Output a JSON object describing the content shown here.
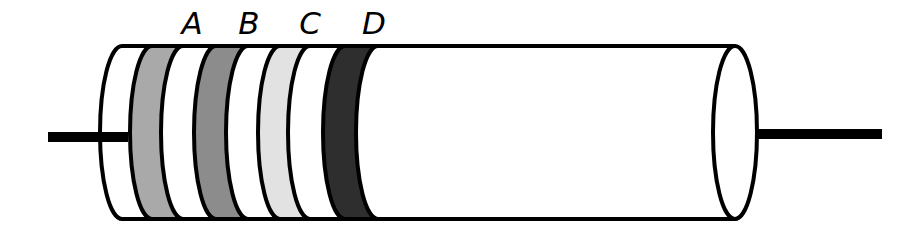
{
  "figure": {
    "name": "resistor-color-band-diagram",
    "background_color": "#ffffff",
    "outline_color": "#000000",
    "body_fill": "#ffffff",
    "width": 919,
    "height": 239
  },
  "body": {
    "label": "resistor-body",
    "left_x": 122,
    "right_x": 735,
    "top_y": 46,
    "bottom_y": 219,
    "cap_rx": 22,
    "stroke_width": 4
  },
  "leads": [
    {
      "name": "left-lead",
      "label": "Left lead wire",
      "color": "#000000",
      "x1": 48,
      "x2": 128,
      "y": 137,
      "thickness": 10
    },
    {
      "name": "right-lead",
      "label": "Right lead wire",
      "color": "#000000",
      "x1": 730,
      "x2": 882,
      "y": 134,
      "thickness": 10
    }
  ],
  "bands": [
    {
      "id": "A",
      "label": "A",
      "name": "color-band-a",
      "fill": "#a9a9a9",
      "left_x": 152,
      "right_x": 183,
      "label_x": 192,
      "label_y": 34
    },
    {
      "id": "B",
      "label": "B",
      "name": "color-band-b",
      "fill": "#8c8c8c",
      "left_x": 216,
      "right_x": 248,
      "label_x": 249,
      "label_y": 34
    },
    {
      "id": "C",
      "label": "C",
      "name": "color-band-c",
      "fill": "#e2e2e2",
      "left_x": 280,
      "right_x": 310,
      "label_x": 310,
      "label_y": 34
    },
    {
      "id": "D",
      "label": "D",
      "name": "color-band-d",
      "fill": "#2e2e2e",
      "left_x": 345,
      "right_x": 378,
      "label_x": 374,
      "label_y": 34
    }
  ]
}
